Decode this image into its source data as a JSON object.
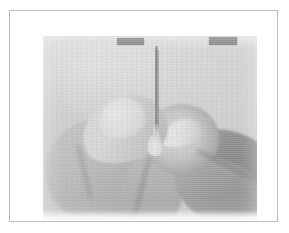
{
  "figure": {
    "alt_text": "Grayscale photograph of a hand holding a thin dropper shaft with a liquid droplet forming at its tip",
    "media_type": "grayscale-photograph",
    "frame": {
      "border_color": "#bdbdbd",
      "background_color": "#ffffff"
    },
    "photo": {
      "background_color": "#e4e4e4",
      "highlight_color": "#ffffff",
      "shadow_color": "#8d8d8d"
    },
    "redaction_marks": [
      {
        "name": "redaction-bar-left",
        "color": "#8f8f8f"
      },
      {
        "name": "redaction-bar-right",
        "color": "#8f8f8f"
      }
    ],
    "elements": {
      "needle_label": "dropper-shaft",
      "droplet_label": "liquid-droplet",
      "hand_label": "hand-fingers"
    }
  }
}
